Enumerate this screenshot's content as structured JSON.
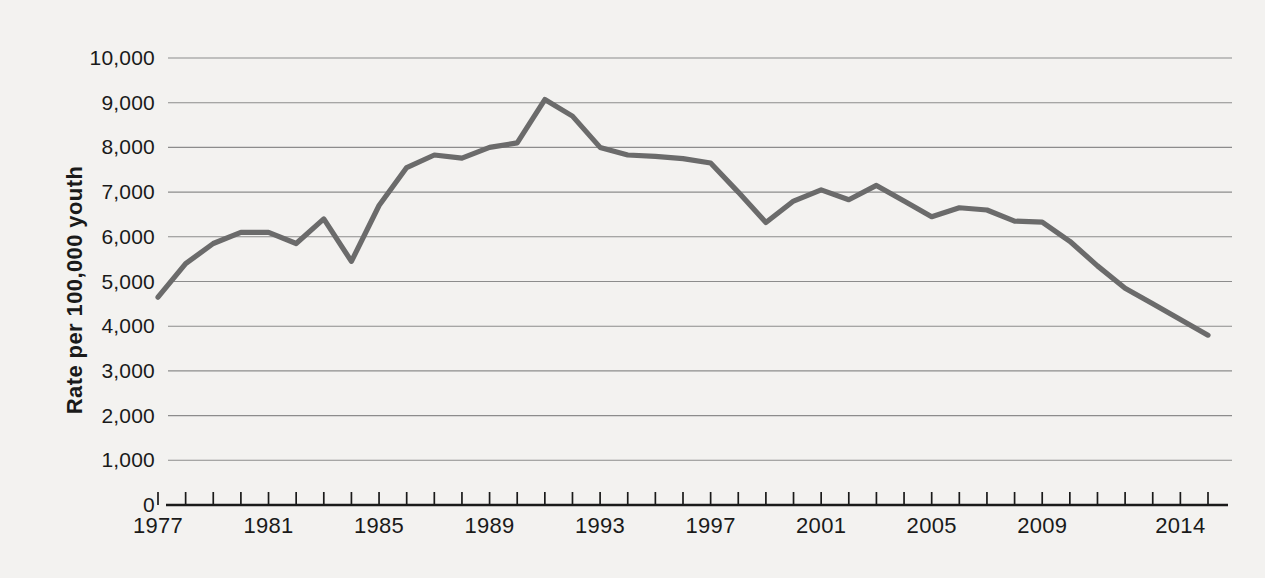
{
  "chart_data": {
    "type": "line",
    "title": "",
    "subtitle": "",
    "xlabel": "",
    "ylabel": "Rate per 100,000 youth",
    "ylim": [
      0,
      10000
    ],
    "xlim": [
      1977,
      2015
    ],
    "grid": true,
    "legend": null,
    "line_color": "#6b6b6b",
    "gridline_color": "#8c8c8c",
    "axis_color": "#1a1a1a",
    "background_color": "#f3f2f0",
    "y_ticks": [
      0,
      1000,
      2000,
      3000,
      4000,
      5000,
      6000,
      7000,
      8000,
      9000,
      10000
    ],
    "y_tick_labels": [
      "0",
      "1,000",
      "2,000",
      "3,000",
      "4,000",
      "5,000",
      "6,000",
      "7,000",
      "8,000",
      "9,000",
      "10,000"
    ],
    "x_tick_years": [
      1977,
      1978,
      1979,
      1980,
      1981,
      1982,
      1983,
      1984,
      1985,
      1986,
      1987,
      1988,
      1989,
      1990,
      1991,
      1992,
      1993,
      1994,
      1995,
      1996,
      1997,
      1998,
      1999,
      2000,
      2001,
      2002,
      2003,
      2004,
      2005,
      2006,
      2007,
      2008,
      2009,
      2010,
      2011,
      2012,
      2013,
      2014,
      2015
    ],
    "x_labeled_ticks": [
      {
        "year": 1977,
        "label": "1977"
      },
      {
        "year": 1981,
        "label": "1981"
      },
      {
        "year": 1985,
        "label": "1985"
      },
      {
        "year": 1989,
        "label": "1989"
      },
      {
        "year": 1993,
        "label": "1993"
      },
      {
        "year": 1997,
        "label": "1997"
      },
      {
        "year": 2001,
        "label": "2001"
      },
      {
        "year": 2005,
        "label": "2005"
      },
      {
        "year": 2009,
        "label": "2009"
      },
      {
        "year": 2014,
        "label": "2014"
      }
    ],
    "x": [
      1977,
      1978,
      1979,
      1980,
      1981,
      1982,
      1983,
      1984,
      1985,
      1986,
      1987,
      1988,
      1989,
      1990,
      1991,
      1992,
      1993,
      1994,
      1995,
      1996,
      1997,
      1998,
      1999,
      2000,
      2001,
      2002,
      2003,
      2004,
      2005,
      2006,
      2007,
      2008,
      2009,
      2010,
      2011,
      2012,
      2013,
      2014,
      2015
    ],
    "values": [
      4650,
      5400,
      5850,
      6100,
      6100,
      5850,
      6400,
      5450,
      6700,
      7550,
      7830,
      7760,
      8000,
      8100,
      9070,
      8700,
      8000,
      7830,
      7800,
      7750,
      7650,
      7000,
      6320,
      6800,
      7050,
      6830,
      7150,
      6800,
      6450,
      6650,
      6600,
      6350,
      6330,
      5900,
      5350,
      4850,
      4500,
      4150,
      3800
    ],
    "series": [
      {
        "name": "Juvenile arrest rate",
        "values": [
          4650,
          5400,
          5850,
          6100,
          6100,
          5850,
          6400,
          5450,
          6700,
          7550,
          7830,
          7760,
          8000,
          8100,
          9070,
          8700,
          8000,
          7830,
          7800,
          7750,
          7650,
          7000,
          6320,
          6800,
          7050,
          6830,
          7150,
          6800,
          6450,
          6650,
          6600,
          6350,
          6330,
          5900,
          5350,
          4850,
          4500,
          4150,
          3800
        ]
      }
    ],
    "peak": {
      "year": 1991,
      "value": 9070
    },
    "minimum": {
      "year": 2015,
      "value": 3800
    }
  }
}
